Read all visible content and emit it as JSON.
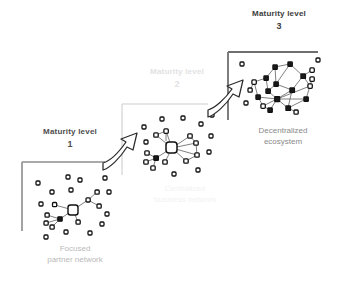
{
  "diagram": {
    "palette": {
      "bracket_level_1": "#8c8c8c",
      "bracket_level_2": "#dedede",
      "bracket_level_3": "#6f6f6f",
      "node_stroke": "#1a1a1a",
      "node_fill": "#ffffff",
      "edge": "#6b6b6b",
      "arrow_stroke": "#2b2b2b",
      "label_dark": "#4d4d4d",
      "label_light": "#e2e2e2",
      "caption_gray": "#8a8a8a",
      "background": "#ffffff"
    },
    "steps": [
      {
        "id": "level-1",
        "level_label": "Maturity level",
        "level_number": "1",
        "caption": "Focused partner network",
        "caption_line_1": "Focused",
        "caption_line_2": "partner network",
        "network_type": "hub-and-spoke with many isolated nodes",
        "hub_count": 1,
        "connected_node_count": 7,
        "isolated_node_count": 13
      },
      {
        "id": "level-2",
        "level_label": "Maturity level",
        "level_number": "2",
        "caption": "Centralized business network",
        "caption_line_1": "Centralized",
        "caption_line_2": "business network",
        "network_type": "centralized hub with secondary clusters",
        "hub_count": 1,
        "connected_node_count": 12,
        "isolated_node_count": 9
      },
      {
        "id": "level-3",
        "level_label": "Maturity level",
        "level_number": "3",
        "caption": "Decentralized ecosystem",
        "caption_line_1": "Decentralized",
        "caption_line_2": "ecosystem",
        "network_type": "dense decentralized mesh",
        "hub_count": 0,
        "connected_node_count": 18,
        "isolated_node_count": 4
      }
    ],
    "transitions": [
      {
        "id": "arrow-level-1-to-2",
        "from": "level-1",
        "to": "level-2",
        "shape": "curved-up-right"
      },
      {
        "id": "arrow-level-2-to-3",
        "from": "level-2",
        "to": "level-3",
        "shape": "curved-up-right"
      }
    ]
  }
}
